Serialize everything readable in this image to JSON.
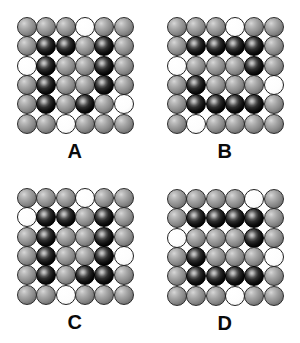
{
  "figure": {
    "type": "lattice-diagram-grid",
    "panel_count": 4,
    "grid_rows": 6,
    "grid_cols": 6,
    "background_color": "#ffffff",
    "atom_types": {
      "gray": "gray-sphere",
      "black": "black-sphere",
      "white": "white-sphere"
    },
    "atom_colors": {
      "gray": "#8a8a8a",
      "black": "#000000",
      "white": "#ffffff",
      "outline": "#2b2b2b",
      "label": "#0a0a0a"
    }
  },
  "panels": [
    {
      "id": "A",
      "label": "A",
      "lattice": [
        [
          "gray",
          "gray",
          "gray",
          "white",
          "gray",
          "gray"
        ],
        [
          "gray",
          "black",
          "black",
          "gray",
          "black",
          "gray"
        ],
        [
          "white",
          "black",
          "gray",
          "gray",
          "black",
          "gray"
        ],
        [
          "gray",
          "black",
          "gray",
          "gray",
          "black",
          "gray"
        ],
        [
          "gray",
          "black",
          "gray",
          "black",
          "gray",
          "white"
        ],
        [
          "gray",
          "gray",
          "white",
          "gray",
          "gray",
          "gray"
        ]
      ]
    },
    {
      "id": "B",
      "label": "B",
      "lattice": [
        [
          "gray",
          "gray",
          "gray",
          "white",
          "gray",
          "gray"
        ],
        [
          "gray",
          "black",
          "black",
          "black",
          "black",
          "gray"
        ],
        [
          "white",
          "gray",
          "gray",
          "gray",
          "black",
          "gray"
        ],
        [
          "gray",
          "black",
          "gray",
          "gray",
          "gray",
          "white"
        ],
        [
          "gray",
          "black",
          "black",
          "black",
          "black",
          "gray"
        ],
        [
          "gray",
          "white",
          "gray",
          "gray",
          "gray",
          "gray"
        ]
      ]
    },
    {
      "id": "C",
      "label": "C",
      "lattice": [
        [
          "gray",
          "gray",
          "gray",
          "white",
          "gray",
          "gray"
        ],
        [
          "white",
          "black",
          "black",
          "gray",
          "black",
          "gray"
        ],
        [
          "gray",
          "black",
          "gray",
          "gray",
          "black",
          "gray"
        ],
        [
          "gray",
          "black",
          "gray",
          "gray",
          "black",
          "white"
        ],
        [
          "gray",
          "black",
          "gray",
          "black",
          "black",
          "gray"
        ],
        [
          "gray",
          "gray",
          "white",
          "gray",
          "gray",
          "gray"
        ]
      ]
    },
    {
      "id": "D",
      "label": "D",
      "lattice": [
        [
          "gray",
          "gray",
          "gray",
          "gray",
          "white",
          "gray"
        ],
        [
          "gray",
          "black",
          "black",
          "black",
          "black",
          "gray"
        ],
        [
          "white",
          "gray",
          "gray",
          "gray",
          "black",
          "gray"
        ],
        [
          "gray",
          "black",
          "gray",
          "gray",
          "gray",
          "white"
        ],
        [
          "gray",
          "black",
          "black",
          "black",
          "black",
          "gray"
        ],
        [
          "gray",
          "gray",
          "gray",
          "white",
          "gray",
          "gray"
        ]
      ]
    }
  ]
}
